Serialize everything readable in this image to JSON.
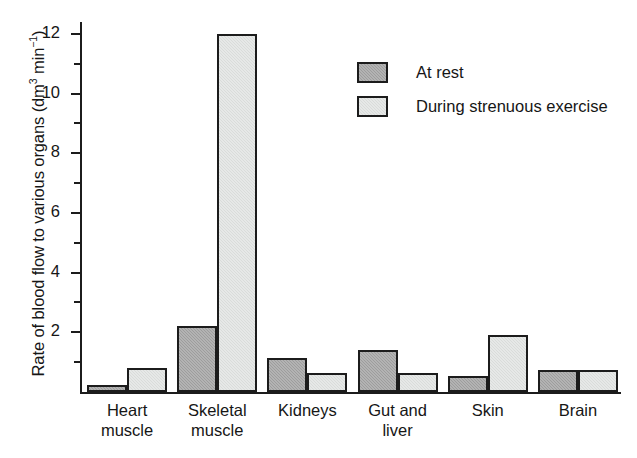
{
  "chart_data": {
    "type": "bar",
    "title": "",
    "xlabel": "",
    "ylabel": "Rate of blood flow to various organs (dm3 min-1)",
    "ylabel_parts": {
      "main": "Rate of blood flow to various organs (dm",
      "sup1": "3",
      "mid": " min",
      "sup2": "−1",
      "end": ")"
    },
    "categories": [
      "Heart muscle",
      "Skeletal muscle",
      "Kidneys",
      "Gut and liver",
      "Skin",
      "Brain"
    ],
    "category_lines": [
      [
        "Heart",
        "muscle"
      ],
      [
        "Skeletal",
        "muscle"
      ],
      [
        "Kidneys",
        ""
      ],
      [
        "Gut and",
        "liver"
      ],
      [
        "Skin",
        ""
      ],
      [
        "Brain",
        ""
      ]
    ],
    "series": [
      {
        "name": "At rest",
        "color": "#9d9d9d",
        "values": [
          0.25,
          2.2,
          1.15,
          1.4,
          0.55,
          0.75
        ]
      },
      {
        "name": "During strenuous exercise",
        "color": "#d9dcda",
        "values": [
          0.8,
          12.0,
          0.65,
          0.65,
          1.9,
          0.75
        ]
      }
    ],
    "ylim": [
      0,
      12.4
    ],
    "y_major_ticks": [
      2,
      4,
      6,
      8,
      10,
      12
    ],
    "y_minor_ticks": [
      1,
      3,
      5,
      7,
      9,
      11
    ],
    "y_tick_labels": [
      "2",
      "4",
      "6",
      "8",
      "10",
      "12"
    ],
    "grid": false,
    "legend_position": "upper-center"
  },
  "legend": {
    "entries": [
      {
        "label": "At rest",
        "swatch": "rest"
      },
      {
        "label": "During strenuous exercise",
        "swatch": "exercise"
      }
    ]
  },
  "axis_colors": {
    "axis_line": "#1c1c1c",
    "bar_outline": "#1c1c1c",
    "rest_fill": "#9d9d9d",
    "exercise_fill": "#d9dcda",
    "background": "#ffffff"
  }
}
